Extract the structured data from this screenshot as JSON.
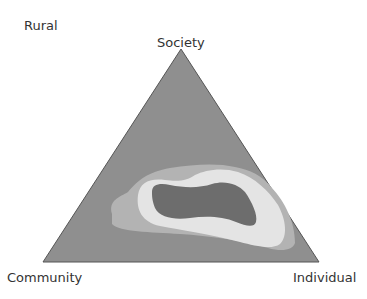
{
  "title": "Rural",
  "vertices": {
    "top": "Society",
    "left": "Community",
    "right": "Individual"
  },
  "colors": {
    "triangle": "#8f8f8f",
    "outer_contour": "#b3b3b3",
    "middle_contour": "#e4e4e4",
    "inner_contour": "#6d6d6d",
    "edge": "#555555"
  },
  "contours": [
    {
      "level": "outer",
      "color": "#b3b3b3"
    },
    {
      "level": "middle",
      "color": "#e4e4e4"
    },
    {
      "level": "inner",
      "color": "#6d6d6d"
    }
  ]
}
